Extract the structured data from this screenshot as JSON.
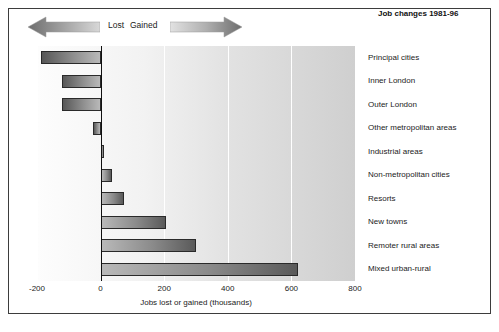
{
  "legend": {
    "lost_label": "Lost",
    "gained_label": "Gained",
    "lost_arrow_icon": "arrow-left-icon",
    "gained_arrow_icon": "arrow-right-icon"
  },
  "title": "Job changes 1981-96",
  "colors": {
    "bar_dark": "#575757",
    "bar_light": "#b9b9b9",
    "axis": "#111111",
    "grid": "#ffffff",
    "frame": "#3d3d3d",
    "text": "#1b1b1b"
  },
  "chart_data": {
    "type": "bar",
    "orientation": "horizontal",
    "title": "Job changes 1981-96",
    "xlabel": "Jobs lost or gained (thousands)",
    "ylabel": "",
    "xlim": [
      -200,
      800
    ],
    "xticks": [
      -200,
      0,
      200,
      400,
      600,
      800
    ],
    "xticklabels": [
      "-200",
      "0",
      "200",
      "400",
      "600",
      "800"
    ],
    "grid": true,
    "legend_position": "top-left",
    "categories": [
      "Principal cities",
      "Inner London",
      "Outer London",
      "Other metropolitan areas",
      "Industrial areas",
      "Non-metropolitan cities",
      "Resorts",
      "New towns",
      "Remoter rural areas",
      "Mixed urban-rural"
    ],
    "values": [
      -187,
      -122,
      -120,
      -25,
      12,
      35,
      75,
      205,
      300,
      620
    ],
    "annotations": [
      "Lost",
      "Gained"
    ]
  }
}
